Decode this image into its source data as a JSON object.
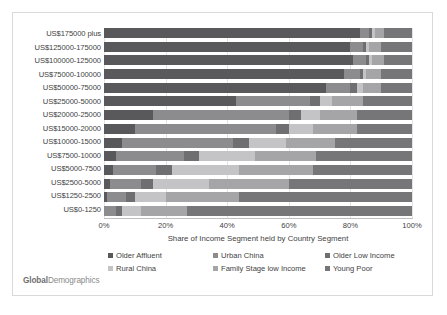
{
  "brand": {
    "bold": "Global",
    "rest": "Demographics"
  },
  "axis": {
    "x_title": "Share of Income Segment held by Country Segment",
    "x_ticks": [
      "0%",
      "20%",
      "40%",
      "60%",
      "80%",
      "100%"
    ]
  },
  "legend": {
    "items": [
      {
        "label": "Older Affluent",
        "color": "#59595b"
      },
      {
        "label": "Urban China",
        "color": "#8c8c8e"
      },
      {
        "label": "Older Low Income",
        "color": "#6f6f71"
      },
      {
        "label": "Rural China",
        "color": "#c4c4c6"
      },
      {
        "label": "Family Stage low Income",
        "color": "#a5a5a7"
      },
      {
        "label": "Young Poor",
        "color": "#767678"
      }
    ]
  },
  "chart_data": {
    "type": "bar",
    "orientation": "horizontal",
    "stacked": true,
    "stack_mode": "percent",
    "title": "",
    "xlabel": "Share of Income Segment held by Country Segment",
    "ylabel": "",
    "xlim": [
      0,
      100
    ],
    "grid": true,
    "legend_position": "bottom",
    "categories": [
      "US$175000 plus",
      "US$125000-175000",
      "US$100000-125000",
      "US$75000-100000",
      "US$50000-75000",
      "US$25000-50000",
      "US$20000-25000",
      "US$15000-20000",
      "US$10000-15000",
      "US$7500-10000",
      "US$5000-7500",
      "US$2500-5000",
      "US$1250-2500",
      "US$0-1250"
    ],
    "series": [
      {
        "name": "Older Affluent",
        "color": "#59595b",
        "values": [
          83,
          80,
          81,
          78,
          72,
          43,
          16,
          10,
          6,
          4,
          3,
          2,
          1,
          0
        ]
      },
      {
        "name": "Urban China",
        "color": "#8c8c8e",
        "values": [
          3,
          4,
          4,
          5,
          8,
          24,
          44,
          46,
          36,
          22,
          14,
          10,
          6,
          4
        ]
      },
      {
        "name": "Older Low Income",
        "color": "#6f6f71",
        "values": [
          1,
          1,
          1,
          1,
          2,
          3,
          4,
          4,
          5,
          5,
          5,
          4,
          3,
          2
        ]
      },
      {
        "name": "Rural China",
        "color": "#c4c4c6",
        "values": [
          1,
          1,
          1,
          1,
          2,
          4,
          6,
          8,
          12,
          18,
          22,
          18,
          10,
          6
        ]
      },
      {
        "name": "Family Stage low Income",
        "color": "#a5a5a7",
        "values": [
          3,
          4,
          4,
          5,
          6,
          10,
          12,
          14,
          16,
          20,
          24,
          26,
          24,
          15
        ]
      },
      {
        "name": "Young Poor",
        "color": "#767678",
        "values": [
          9,
          10,
          9,
          10,
          10,
          16,
          18,
          18,
          25,
          31,
          32,
          40,
          56,
          73
        ]
      }
    ]
  }
}
